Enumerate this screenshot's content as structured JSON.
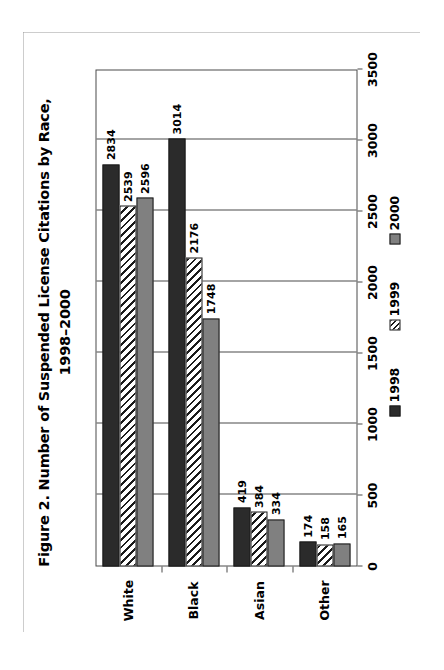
{
  "figure": {
    "title_line1": "Figure 2.  Number of Suspended License Citations by Race,",
    "title_line2": "1998–2000"
  },
  "chart_data": {
    "type": "bar",
    "orientation": "horizontal",
    "title": "Figure 2.  Number of Suspended License Citations by Race, 1998–2000",
    "xlabel": "",
    "ylabel": "",
    "categories": [
      "White",
      "Black",
      "Asian",
      "Other"
    ],
    "series": [
      {
        "name": "1998",
        "values": [
          2834,
          3014,
          419,
          174
        ],
        "style": "solid-dark",
        "color": "#2b2b2b"
      },
      {
        "name": "1999",
        "values": [
          2539,
          2176,
          384,
          158
        ],
        "style": "diagonal-hatch",
        "color": "#ffffff"
      },
      {
        "name": "2000",
        "values": [
          2596,
          1748,
          334,
          165
        ],
        "style": "solid-gray",
        "color": "#808080"
      }
    ],
    "value_axis_ticks": [
      "0",
      "500",
      "1000",
      "1500",
      "2000",
      "2500",
      "3000",
      "3500"
    ],
    "value_axis_tick_numbers": [
      0,
      500,
      1000,
      1500,
      2000,
      2500,
      3000,
      3500
    ],
    "xlim": [
      0,
      3500
    ],
    "grid": true,
    "data_labels_shown": true,
    "legend_position": "bottom",
    "legend_entries": [
      "1998",
      "1999",
      "2000"
    ]
  }
}
